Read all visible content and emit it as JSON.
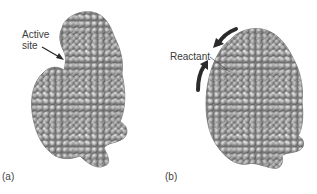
{
  "figure": {
    "panels": [
      {
        "id": "a",
        "letter": "(a)",
        "annotation": {
          "line1": "Active",
          "line2": "site"
        },
        "description": "Enzyme space-filling model with open active site"
      },
      {
        "id": "b",
        "letter": "(b)",
        "annotation": {
          "line1": "Reactant"
        },
        "description": "Enzyme closed around reactant, curved arrows showing conformational change"
      }
    ],
    "colors": {
      "molecule": "#a8a8a8",
      "molecule_shadow": "#6e6e6e",
      "arrow": "#2b2b2b",
      "text": "#3a3a3a"
    }
  }
}
